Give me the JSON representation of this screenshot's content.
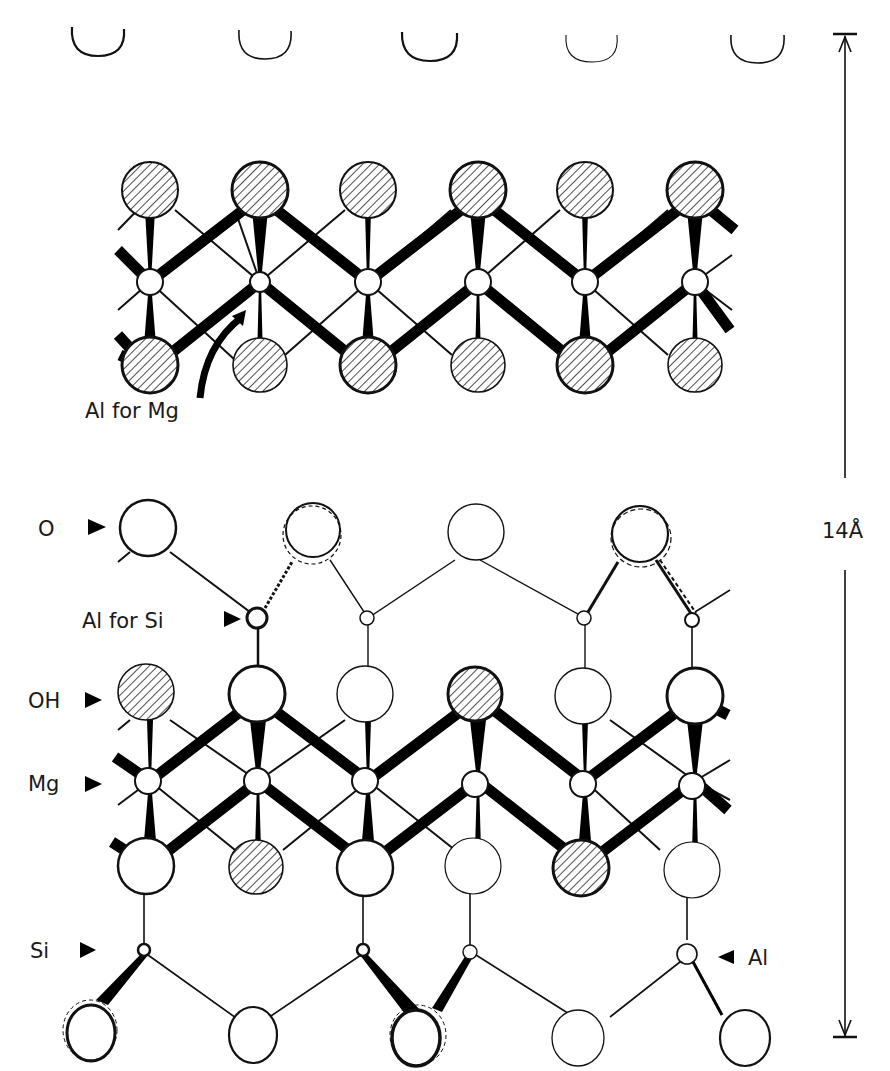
{
  "diagram": {
    "colors": {
      "ink": "#111111",
      "background": "#ffffff"
    },
    "labels": {
      "al_for_mg": "Al for Mg",
      "o": "O",
      "al_for_si": "Al for Si",
      "oh": "OH",
      "mg": "Mg",
      "si": "Si",
      "al": "Al",
      "spacing": "14Å"
    },
    "columns_x": [
      148,
      260,
      368,
      478,
      585,
      695
    ],
    "top_cups_x": [
      98,
      265,
      430,
      592,
      758
    ],
    "brucite_layer": {
      "top_row_y": 197,
      "mid_row_y": 282,
      "bottom_row_y": 370,
      "top_radius": 30,
      "bottom_radius": 28,
      "cation_radius": 12
    },
    "talc_layer": {
      "upper_o_y": 538,
      "upper_tet_y": 618,
      "oh_y": 698,
      "mg_y": 781,
      "lower_o_y": 865,
      "lower_tet_y": 950,
      "bottom_o_y": 1035
    },
    "dimension_line": {
      "x": 845,
      "top_y": 37,
      "bottom_y": 1038
    }
  }
}
